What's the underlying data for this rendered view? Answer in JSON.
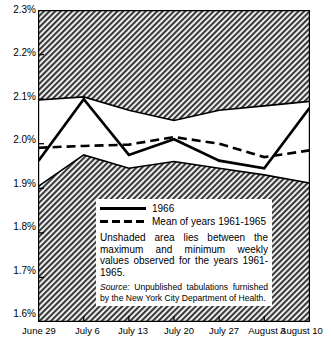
{
  "chart_data": {
    "type": "line",
    "title": "",
    "subtitle": "",
    "xlabel": "",
    "ylabel": "",
    "categories": [
      "June 29",
      "July 6",
      "July 13",
      "July 20",
      "July 27",
      "August 3",
      "August 10"
    ],
    "ylim": [
      1.6,
      2.3
    ],
    "yticks": [
      1.6,
      1.7,
      1.8,
      1.9,
      2.0,
      2.1,
      2.2,
      2.3
    ],
    "ytick_labels": [
      "1.6%",
      "1.7%",
      "1.8%",
      "1.9%",
      "2.0%",
      "2.1%",
      "2.2%",
      "2.3%"
    ],
    "grid": false,
    "legend_position": "inside-lower-right",
    "series": [
      {
        "name": "1966",
        "style": "solid",
        "color": "#000000",
        "values": [
          1.962,
          2.1,
          1.975,
          2.01,
          1.962,
          1.945,
          2.08
        ]
      },
      {
        "name": "Mean of years 1961-1965",
        "style": "dashed",
        "color": "#000000",
        "values": [
          1.991,
          1.995,
          1.998,
          2.015,
          2.0,
          1.97,
          1.985
        ]
      },
      {
        "name": "Maximum weekly values 1961-1965",
        "style": "band-upper",
        "color": "#000000",
        "values": [
          2.098,
          2.105,
          2.075,
          2.052,
          2.075,
          2.085,
          2.095
        ]
      },
      {
        "name": "Minimum weekly values 1961-1965",
        "style": "band-lower",
        "color": "#000000",
        "values": [
          1.905,
          1.975,
          1.945,
          1.96,
          1.945,
          1.93,
          1.912
        ]
      }
    ]
  },
  "yaxis": {
    "ticks": [
      {
        "label": "2.3%"
      },
      {
        "label": "2.2%"
      },
      {
        "label": "2.1%"
      },
      {
        "label": "2.0%"
      },
      {
        "label": "1.9%"
      },
      {
        "label": "1.8%"
      },
      {
        "label": "1.7%"
      },
      {
        "label": "1.6%"
      }
    ]
  },
  "xaxis": {
    "ticks": [
      {
        "label": "June 29"
      },
      {
        "label": "July 6"
      },
      {
        "label": "July 13"
      },
      {
        "label": "July 20"
      },
      {
        "label": "July 27"
      },
      {
        "label": "August 3"
      },
      {
        "label": "August 10"
      }
    ]
  },
  "legend": {
    "entries": [
      {
        "label": "1966",
        "style": "solid"
      },
      {
        "label": "Mean of years 1961-1965",
        "style": "dashed"
      }
    ],
    "note": "Unshaded area lies between the maximum and minimum weekly values observed for the years 1961-1965.",
    "source_word": "Source:",
    "source_text": " Unpublished tabulations furnished by the New York City Department of Health."
  },
  "colors": {
    "shaded_band": "#808080",
    "unshaded_band": "#ffffff",
    "line": "#000000",
    "axis": "#000000",
    "background": "#ffffff"
  }
}
